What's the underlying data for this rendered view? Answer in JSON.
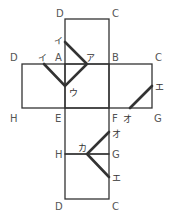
{
  "diagram": {
    "type": "cube-net",
    "vertex_labels": {
      "top_D": "D",
      "top_C": "C",
      "left_D": "D",
      "A": "A",
      "B": "B",
      "right_C": "C",
      "left_H": "H",
      "E": "E",
      "F": "F",
      "G": "G",
      "mid_H": "H",
      "mid_G": "G",
      "bottom_D": "D",
      "bottom_C": "C"
    },
    "point_labels": {
      "a": "ア",
      "i_top": "イ",
      "i_left": "イ",
      "u": "ウ",
      "e_right": "エ",
      "o_right": "オ",
      "ka": "カ",
      "o_bottom": "オ",
      "e_bottom": "エ"
    }
  }
}
